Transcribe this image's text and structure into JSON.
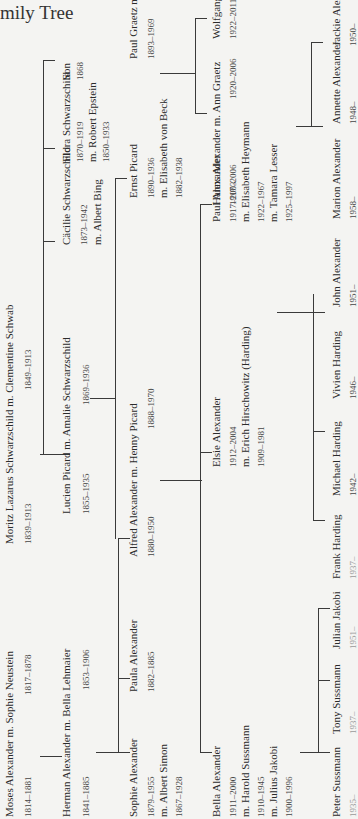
{
  "page": {
    "title_visible": "mily Tree",
    "title_full": "Family Tree"
  },
  "generation1": {
    "alexander_couple": {
      "label": "Moses Alexander m. Sophie Neustein",
      "dates_husband": "1814–1881",
      "dates_wife": "1817–1878"
    },
    "schwarzschild_couple": {
      "label": "Moritz Lazarus Schwarzschild m. Clementine Schwab",
      "dates_husband": "1839–1913",
      "dates_wife": "1849–1913"
    }
  },
  "generation2": {
    "herman": {
      "label": "Herman Alexander m. Bella Lehmaier",
      "dates_husband": "1841–1885",
      "dates_wife": "1853–1906"
    },
    "lucien": {
      "label": "Lucien Picard m. Amalie Schwarzschild",
      "dates_husband": "1855–1935",
      "dates_wife": "1869–1936"
    },
    "caecilie": {
      "name": "Cäcilie Schwarzschild",
      "dates": "1873–1942",
      "spouse": "m. Albert Bing"
    },
    "flora": {
      "name": "Flora Schwarzschild",
      "dates": "1870–1919",
      "spouse": "m. Robert Epstein",
      "spouse_dates": "1850–1933"
    },
    "son": {
      "name": "Son",
      "dates": "1868"
    }
  },
  "generation3": {
    "sophie": {
      "name": "Sophie Alexander",
      "dates": "1879–1955",
      "spouse": "m. Albert Simon",
      "spouse_dates": "1867–1928"
    },
    "paula": {
      "name": "Paula Alexander",
      "dates": "1882–1885"
    },
    "alfred": {
      "label": "Alfred Alexander m. Henny Picard",
      "dates_husband": "1880–1950",
      "dates_wife": "1888–1970"
    },
    "ernst": {
      "name": "Ernst Picard",
      "dates": "1890–1936",
      "spouse": "m. Elisabeth von Beck",
      "spouse_dates": "1882–1938"
    },
    "graetz": {
      "label": "Paul Graetz m. Käte Meyer",
      "dates_husband": "1893–1969",
      "dates_wife": "1895–1980"
    }
  },
  "generation4": {
    "bella": {
      "name": "Bella Alexander",
      "dates": "1911–2000",
      "spouse1": "m. Harold Sussmann",
      "spouse1_dates": "1910–1945",
      "spouse2": "m. Julius Jakobi",
      "spouse2_dates": "1900–1996"
    },
    "elsie": {
      "name": "Elsie Alexander",
      "dates": "1912–2004",
      "spouse": "m. Erich Hirschowitz (Harding)",
      "spouse_dates": "1909–1981"
    },
    "paul": {
      "name": "Paul Alexander",
      "dates": "1917–2003",
      "spouse1": "m. Elisabeth Heymann",
      "spouse1_dates": "1922–1967",
      "spouse2": "m. Tamara Lesser",
      "spouse2_dates": "1925–1997"
    },
    "hanns": {
      "label": "Hanns Alexander m. Ann Graetz",
      "dates_husband": "1917–2006",
      "dates_wife": "1920–2006"
    },
    "wolfgang": {
      "name": "Wolfgang Grey",
      "dates": "1922–2011"
    }
  },
  "generation5": {
    "peter": {
      "name": "Peter Sussmann",
      "dates": "1935–"
    },
    "tony": {
      "name": "Tony Sussmann",
      "dates": "1937–"
    },
    "julian": {
      "name": "Julian Jakobi",
      "dates": "1951–"
    },
    "frank": {
      "name": "Frank Harding",
      "dates": "1937–"
    },
    "michael": {
      "name": "Michael Harding",
      "dates": "1942–"
    },
    "vivien": {
      "name": "Vivien Harding",
      "dates": "1946–"
    },
    "john": {
      "name": "John Alexander",
      "dates": "1951–"
    },
    "marion": {
      "name": "Marion Alexander",
      "dates": "1958–"
    },
    "annette": {
      "name": "Annette Alexander",
      "dates": "1948–"
    },
    "jackie": {
      "name": "Jackie Alexander",
      "dates": "1950–"
    }
  }
}
